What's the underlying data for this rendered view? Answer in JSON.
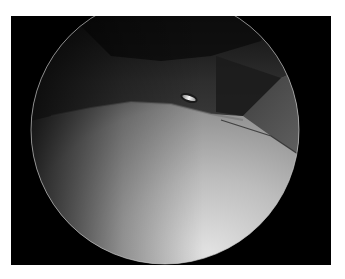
{
  "image": {
    "kind": "arthroscopic view",
    "description": "Circular endoscopic field showing a bright smooth cartilage surface, dark tissue band at top, ligament on the right, and a small metallic instrument tip",
    "colors": {
      "page_background": "#ffffff",
      "frame_background": "#000000",
      "cartilage_bright": "#d9d9d9",
      "cartilage_mid": "#9a9a9a",
      "tissue_dark": "#2a2a2a",
      "ligament": "#5a5a5a",
      "instrument_highlight": "#f2f2f2",
      "scope_rim": "#cfcfcf"
    }
  }
}
